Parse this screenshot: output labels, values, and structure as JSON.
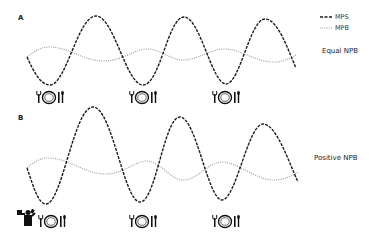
{
  "panels": [
    {
      "label": "A",
      "condition": "Equal NPB",
      "meals": 3,
      "exercise": false
    },
    {
      "label": "B",
      "condition": "Positive NPB",
      "meals": 3,
      "exercise": true
    }
  ],
  "legend": [
    {
      "label": "MPS",
      "style": "dashed"
    },
    {
      "label": "MPB",
      "style": "dotted"
    }
  ],
  "icons": {
    "meal": "fork-plate-knife-icon",
    "exercise": "weightlifter-icon"
  },
  "colors": {
    "mps": "#1a1a1a",
    "mpb": "#9a9a9a"
  }
}
